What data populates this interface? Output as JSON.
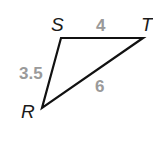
{
  "diagram": {
    "type": "triangle",
    "vertices": [
      {
        "name": "S",
        "x": 61,
        "y": 38
      },
      {
        "name": "T",
        "x": 143,
        "y": 38
      },
      {
        "name": "R",
        "x": 42,
        "y": 108
      }
    ],
    "sides": [
      {
        "from": "S",
        "to": "T",
        "length": "4"
      },
      {
        "from": "S",
        "to": "R",
        "length": "3.5"
      },
      {
        "from": "R",
        "to": "T",
        "length": "6"
      }
    ],
    "colors": {
      "line": "#111111",
      "vertex_label": "#1a1a1a",
      "side_label": "#9a9a9a"
    }
  }
}
